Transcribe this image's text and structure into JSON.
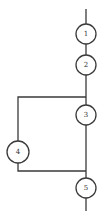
{
  "diagram": {
    "type": "flow-graph",
    "nodes": [
      {
        "id": "1",
        "label": "1",
        "cx": 86,
        "cy": 34,
        "r": 10
      },
      {
        "id": "2",
        "label": "2",
        "cx": 86,
        "cy": 65,
        "r": 10
      },
      {
        "id": "3",
        "label": "3",
        "cx": 86,
        "cy": 115,
        "r": 10
      },
      {
        "id": "4",
        "label": "4",
        "cx": 18,
        "cy": 152,
        "r": 11
      },
      {
        "id": "5",
        "label": "5",
        "cx": 86,
        "cy": 188,
        "r": 10
      }
    ],
    "edges": [
      {
        "from": "entry",
        "to": "1"
      },
      {
        "from": "1",
        "to": "2"
      },
      {
        "from": "2",
        "to": "3"
      },
      {
        "from": "2",
        "to": "4"
      },
      {
        "from": "3",
        "to": "5"
      },
      {
        "from": "4",
        "to": "5"
      },
      {
        "from": "5",
        "to": "exit"
      }
    ]
  }
}
